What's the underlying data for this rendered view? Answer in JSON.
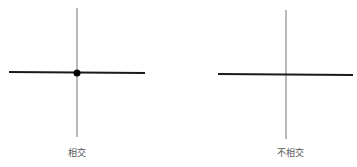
{
  "diagrams": [
    {
      "label": "相交",
      "horizontal": {
        "x1": 9,
        "y1": 72,
        "x2": 145,
        "y2": 73
      },
      "vertical": {
        "x1": 77,
        "y1": 8,
        "x2": 77,
        "y2": 137
      },
      "intersection_point": {
        "cx": 77,
        "cy": 73,
        "r": 3.5,
        "shown": true
      },
      "label_pos": {
        "x": 77,
        "y": 147
      }
    },
    {
      "label": "不相交",
      "horizontal": {
        "x1": 218,
        "y1": 74,
        "x2": 353,
        "y2": 75
      },
      "vertical": {
        "x1": 286,
        "y1": 10,
        "x2": 286,
        "y2": 139
      },
      "intersection_point": {
        "shown": false
      },
      "label_pos": {
        "x": 290,
        "y": 147
      }
    }
  ],
  "colors": {
    "horizontal_line": "#1a1a1a",
    "vertical_line": "#8a8a8a",
    "dot": "#000000",
    "label": "#555555"
  }
}
